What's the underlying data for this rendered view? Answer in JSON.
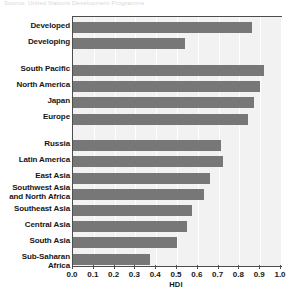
{
  "figure": {
    "top_caption_fragment": "Source: United Nations Development Programme"
  },
  "chart_data": {
    "type": "bar",
    "orientation": "horizontal",
    "title": "",
    "subtitle": "",
    "xlabel": "HDI",
    "ylabel": "",
    "xlim": [
      0.0,
      1.0
    ],
    "ylim": null,
    "grid": true,
    "grid_axis": "x",
    "legend": false,
    "legend_position": "none",
    "bar_color": "#777777",
    "plot_background": "#f2f2f2",
    "gridline_color": "#ffffff",
    "axis_color": "#4d4d4d",
    "categories": [
      "Developed",
      "Developing",
      "South Pacific",
      "North America",
      "Japan",
      "Europe",
      "Russia",
      "Latin America",
      "East Asia",
      "Southwest Asia and North Africa",
      "Southeast Asia",
      "Central Asia",
      "South Asia",
      "Sub-Saharan Africa"
    ],
    "values": [
      0.86,
      0.54,
      0.92,
      0.9,
      0.87,
      0.84,
      0.71,
      0.72,
      0.66,
      0.63,
      0.57,
      0.55,
      0.5,
      0.37
    ],
    "groups": [
      {
        "name": "Development level",
        "categories": [
          "Developed",
          "Developing"
        ]
      },
      {
        "name": "High HDI regions",
        "categories": [
          "South Pacific",
          "North America",
          "Japan",
          "Europe"
        ]
      },
      {
        "name": "Other regions",
        "categories": [
          "Russia",
          "Latin America",
          "East Asia",
          "Southwest Asia and North Africa",
          "Southeast Asia",
          "Central Asia",
          "South Asia",
          "Sub-Saharan Africa"
        ]
      }
    ],
    "xticks": [
      0.0,
      0.1,
      0.2,
      0.3,
      0.4,
      0.5,
      0.6,
      0.7,
      0.8,
      0.9,
      1.0
    ],
    "xticklabels": [
      "0.0",
      "0.1",
      "0.2",
      "0.3",
      "0.4",
      "0.5",
      "0.6",
      "0.7",
      "0.8",
      "0.9",
      "1.0"
    ]
  },
  "labels": {
    "items": [
      {
        "text": "Developed",
        "lines": [
          "Developed"
        ]
      },
      {
        "text": "Developing",
        "lines": [
          "Developing"
        ]
      },
      {
        "text": "South Pacific",
        "lines": [
          "South Pacific"
        ]
      },
      {
        "text": "North America",
        "lines": [
          "North America"
        ]
      },
      {
        "text": "Japan",
        "lines": [
          "Japan"
        ]
      },
      {
        "text": "Europe",
        "lines": [
          "Europe"
        ]
      },
      {
        "text": "Russia",
        "lines": [
          "Russia"
        ]
      },
      {
        "text": "Latin America",
        "lines": [
          "Latin America"
        ]
      },
      {
        "text": "East Asia",
        "lines": [
          "East Asia"
        ]
      },
      {
        "text": "Southwest Asia and North Africa",
        "lines": [
          "Southwest Asia",
          "and North Africa"
        ]
      },
      {
        "text": "Southeast Asia",
        "lines": [
          "Southeast Asia"
        ]
      },
      {
        "text": "Central Asia",
        "lines": [
          "Central Asia"
        ]
      },
      {
        "text": "South Asia",
        "lines": [
          "South Asia"
        ]
      },
      {
        "text": "Sub-Saharan Africa",
        "lines": [
          "Sub-Saharan Africa"
        ]
      }
    ]
  }
}
